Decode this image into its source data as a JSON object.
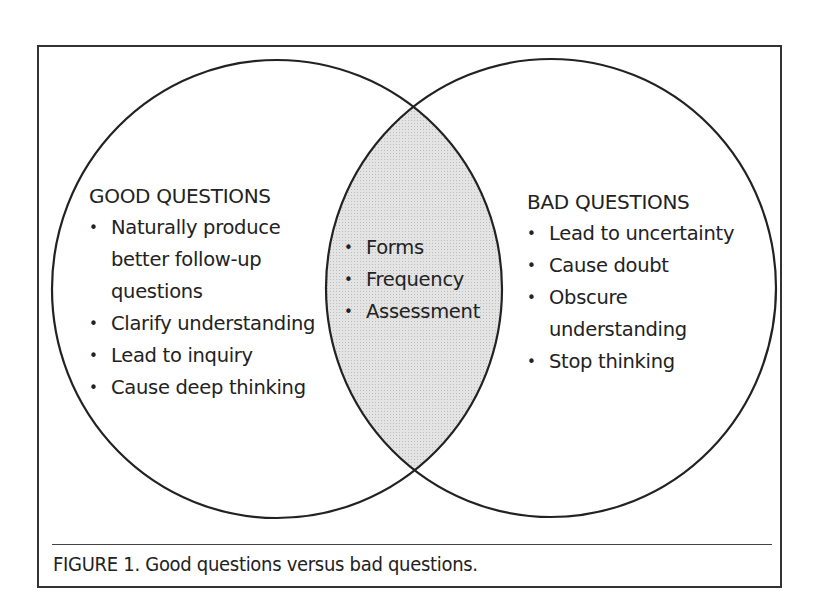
{
  "diagram": {
    "type": "venn",
    "left_set": {
      "title": "GOOD QUESTIONS",
      "items": [
        "Naturally produce better follow-up questions",
        "Clarify understanding",
        "Lead to inquiry",
        "Cause deep thinking"
      ],
      "lines": [
        "Naturally produce",
        "better follow-up",
        "questions"
      ]
    },
    "right_set": {
      "title": "BAD QUESTIONS",
      "items": [
        "Lead to uncertainty",
        "Cause doubt",
        "Obscure understanding",
        "Stop thinking"
      ],
      "lines": [
        "Obscure",
        "understanding"
      ]
    },
    "intersection": {
      "items": [
        "Forms",
        "Frequency",
        "Assessment"
      ]
    },
    "colors": {
      "outline": "#222222",
      "intersection_fill": "#dcdcdc",
      "background": "#ffffff"
    }
  },
  "caption": {
    "label": "FIGURE 1",
    "text": ". Good questions versus bad questions."
  }
}
